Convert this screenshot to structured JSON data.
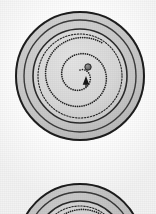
{
  "figure": {
    "kind": "photographic-plate",
    "background_color": "#fdfdfd",
    "objects": [
      {
        "id": "disc-upper",
        "label": "upper-disc",
        "center_x": 80,
        "center_y": 76,
        "outer_radius": 65,
        "rim_outer_stroke": "#1a1a1a",
        "rim_band_fill": "#c9c9c9",
        "field_fill": "#d9d9d9",
        "rings": [
          {
            "name": "outer-rim",
            "radius": 64,
            "stroke": "#1f1f1f",
            "width": 2.0,
            "style": "solid"
          },
          {
            "name": "rim-inner-edge",
            "radius": 56,
            "stroke": "#3a3a3a",
            "width": 1.4,
            "style": "solid"
          },
          {
            "name": "field-border",
            "radius": 47,
            "stroke": "#2b2b2b",
            "width": 1.6,
            "style": "solid"
          }
        ],
        "spiral": {
          "style": "dotted",
          "dot_color": "#232323",
          "turns": 2.1,
          "start_radius": 6,
          "end_radius": 40,
          "dot_radius": 0.85,
          "dot_spacing": 2.2
        },
        "center_marker": {
          "name": "center-boss",
          "x": 88,
          "y": 67,
          "radius": 3.2,
          "fill": "#6e6e6e",
          "stroke": "#1c1c1c"
        },
        "pointer": {
          "name": "arrowhead",
          "x": 86,
          "y": 82,
          "size": 6,
          "direction": "up",
          "fill": "#141414"
        }
      },
      {
        "id": "disc-lower",
        "label": "lower-disc-partial",
        "center_x": 80,
        "center_y": 246,
        "outer_radius": 63,
        "rim_outer_stroke": "#1a1a1a",
        "rim_band_fill": "#c9c9c9",
        "field_fill": "#d9d9d9",
        "rings": [
          {
            "name": "outer-rim",
            "radius": 62,
            "stroke": "#1f1f1f",
            "width": 2.0,
            "style": "solid"
          },
          {
            "name": "rim-inner-edge",
            "radius": 54,
            "stroke": "#3a3a3a",
            "width": 1.4,
            "style": "solid"
          },
          {
            "name": "field-border",
            "radius": 45,
            "stroke": "#2b2b2b",
            "width": 1.6,
            "style": "solid"
          }
        ],
        "spiral": {
          "style": "dotted",
          "dot_color": "#232323",
          "turns": 2.1,
          "start_radius": 6,
          "end_radius": 38,
          "dot_radius": 0.85,
          "dot_spacing": 2.2
        },
        "center_marker": {
          "name": "center-boss",
          "x": 88,
          "y": 237,
          "radius": 3.2,
          "fill": "#6e6e6e",
          "stroke": "#1c1c1c"
        },
        "pointer": {
          "name": "arrowhead",
          "x": 86,
          "y": 252,
          "size": 6,
          "direction": "up",
          "fill": "#141414"
        }
      }
    ]
  },
  "palette": {
    "paper": "#fdfdfd",
    "disc_field": "#d9d9d9",
    "disc_rim": "#c9c9c9",
    "ink": "#1f1f1f",
    "boss": "#6e6e6e"
  },
  "labels": {
    "figure_caption": "",
    "upper_disc_name": "Upper disc",
    "lower_disc_name": "Lower disc"
  }
}
